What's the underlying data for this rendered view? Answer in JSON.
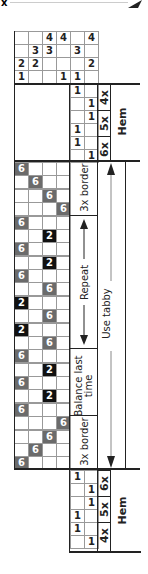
{
  "header": {
    "left_mark": "x",
    "right_mark": "arrow-icon"
  },
  "tieup": {
    "rows": [
      [
        "",
        "",
        "4",
        "4",
        "",
        "4"
      ],
      [
        "",
        "3",
        "3",
        "",
        "3",
        ""
      ],
      [
        "2",
        "2",
        "",
        "",
        "",
        "2"
      ],
      [
        "1",
        "",
        "",
        "1",
        "1",
        ""
      ]
    ]
  },
  "top_hem": {
    "rows": [
      [
        "1",
        ""
      ],
      [
        "",
        "1"
      ],
      [
        "",
        "1"
      ],
      [
        "1",
        ""
      ],
      [
        "1",
        ""
      ],
      [
        "",
        "1"
      ]
    ],
    "repeat_labels": [
      "4x",
      "5x",
      "6x"
    ],
    "label": "Hem"
  },
  "threading": {
    "rows": [
      {
        "col": 0,
        "val": "6",
        "shade": "g"
      },
      {
        "col": 1,
        "val": "6",
        "shade": "g"
      },
      {
        "col": 2,
        "val": "6",
        "shade": "g"
      },
      {
        "col": 3,
        "val": "6",
        "shade": "g"
      },
      {
        "col": 0,
        "val": "6",
        "shade": "g"
      },
      {
        "col": 2,
        "val": "2",
        "shade": "k"
      },
      {
        "col": 0,
        "val": "6",
        "shade": "g"
      },
      {
        "col": 2,
        "val": "2",
        "shade": "k"
      },
      {
        "col": 0,
        "val": "6",
        "shade": "g"
      },
      {
        "col": 2,
        "val": "6",
        "shade": "g"
      },
      {
        "col": 0,
        "val": "2",
        "shade": "k"
      },
      {
        "col": 2,
        "val": "6",
        "shade": "g"
      },
      {
        "col": 0,
        "val": "2",
        "shade": "k"
      },
      {
        "col": 2,
        "val": "6",
        "shade": "g"
      },
      {
        "col": 0,
        "val": "6",
        "shade": "g"
      },
      {
        "col": 2,
        "val": "2",
        "shade": "k"
      },
      {
        "col": 0,
        "val": "6",
        "shade": "g"
      },
      {
        "col": 2,
        "val": "2",
        "shade": "k"
      },
      {
        "col": 0,
        "val": "6",
        "shade": "g"
      },
      {
        "col": 3,
        "val": "6",
        "shade": "g"
      },
      {
        "col": 2,
        "val": "6",
        "shade": "g"
      },
      {
        "col": 1,
        "val": "6",
        "shade": "g"
      },
      {
        "col": 0,
        "val": "6",
        "shade": "g"
      }
    ]
  },
  "annotations": {
    "border_top": "3x border",
    "repeat": "Repeat",
    "balance": "Balance last time",
    "border_bottom": "3x border",
    "tabby": "Use tabby"
  },
  "bottom_hem": {
    "rows": [
      [
        "1",
        ""
      ],
      [
        "",
        "1"
      ],
      [
        "",
        "1"
      ],
      [
        "1",
        ""
      ],
      [
        "1",
        ""
      ],
      [
        "",
        "1"
      ]
    ],
    "repeat_labels": [
      "6x",
      "5x",
      "4x"
    ],
    "label": "Hem"
  },
  "colors": {
    "gray_cell": "#6b6b6b",
    "black_cell": "#111111",
    "grid": "#999999",
    "line": "#222222"
  }
}
